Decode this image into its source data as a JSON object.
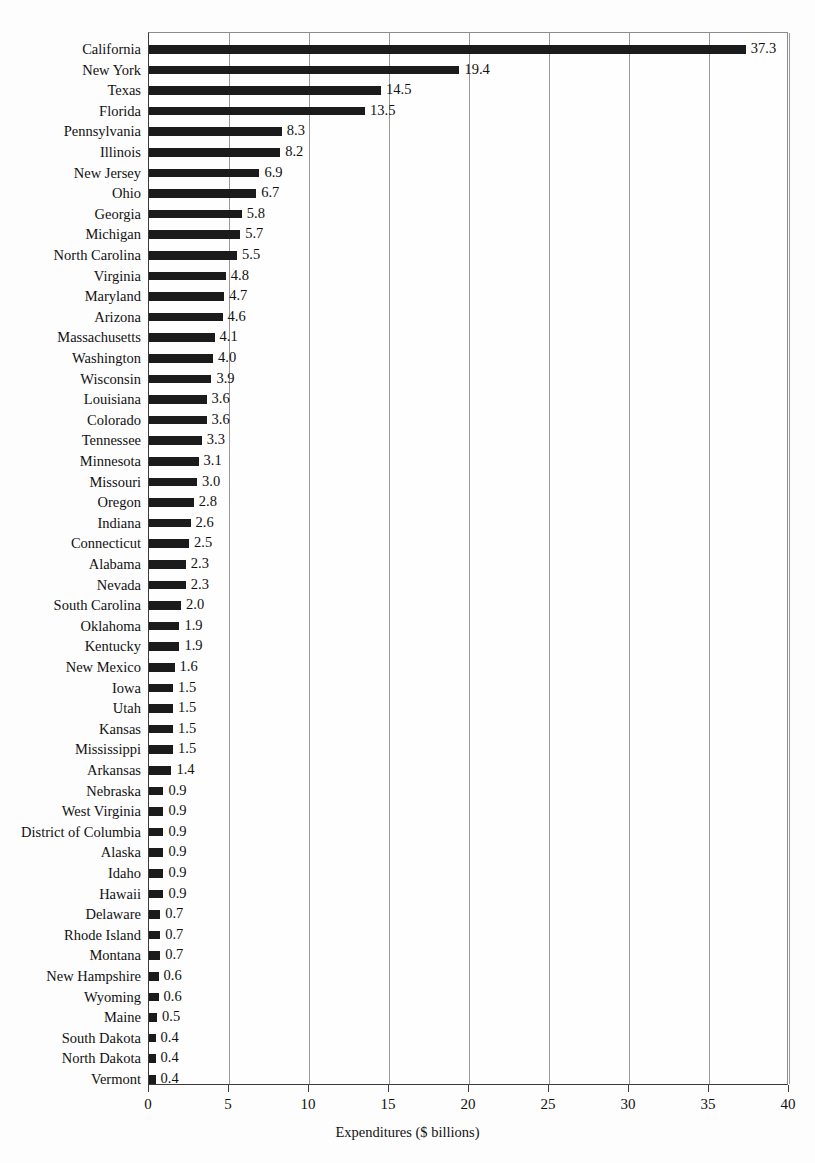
{
  "chart_data": {
    "type": "bar",
    "orientation": "horizontal",
    "title": "",
    "xlabel": "Expenditures ($ billions)",
    "ylabel": "",
    "xlim": [
      0,
      40
    ],
    "xticks": [
      0,
      5,
      10,
      15,
      20,
      25,
      30,
      35,
      40
    ],
    "grid": "vertical",
    "legend": "none",
    "bar_color": "#1b1b1b",
    "categories": [
      "California",
      "New York",
      "Texas",
      "Florida",
      "Pennsylvania",
      "Illinois",
      "New Jersey",
      "Ohio",
      "Georgia",
      "Michigan",
      "North Carolina",
      "Virginia",
      "Maryland",
      "Arizona",
      "Massachusetts",
      "Washington",
      "Wisconsin",
      "Louisiana",
      "Colorado",
      "Tennessee",
      "Minnesota",
      "Missouri",
      "Oregon",
      "Indiana",
      "Connecticut",
      "Alabama",
      "Nevada",
      "South Carolina",
      "Oklahoma",
      "Kentucky",
      "New Mexico",
      "Iowa",
      "Utah",
      "Kansas",
      "Mississippi",
      "Arkansas",
      "Nebraska",
      "West Virginia",
      "District of Columbia",
      "Alaska",
      "Idaho",
      "Hawaii",
      "Delaware",
      "Rhode Island",
      "Montana",
      "New Hampshire",
      "Wyoming",
      "Maine",
      "South Dakota",
      "North Dakota",
      "Vermont"
    ],
    "values": [
      37.3,
      19.4,
      14.5,
      13.5,
      8.3,
      8.2,
      6.9,
      6.7,
      5.8,
      5.7,
      5.5,
      4.8,
      4.7,
      4.6,
      4.1,
      4.0,
      3.9,
      3.6,
      3.6,
      3.3,
      3.1,
      3.0,
      2.8,
      2.6,
      2.5,
      2.3,
      2.3,
      2.0,
      1.9,
      1.9,
      1.6,
      1.5,
      1.5,
      1.5,
      1.5,
      1.4,
      0.9,
      0.9,
      0.9,
      0.9,
      0.9,
      0.9,
      0.7,
      0.7,
      0.7,
      0.6,
      0.6,
      0.5,
      0.4,
      0.4,
      0.4
    ],
    "value_labels": [
      "37.3",
      "19.4",
      "14.5",
      "13.5",
      "8.3",
      "8.2",
      "6.9",
      "6.7",
      "5.8",
      "5.7",
      "5.5",
      "4.8",
      "4.7",
      "4.6",
      "4.1",
      "4.0",
      "3.9",
      "3.6",
      "3.6",
      "3.3",
      "3.1",
      "3.0",
      "2.8",
      "2.6",
      "2.5",
      "2.3",
      "2.3",
      "2.0",
      "1.9",
      "1.9",
      "1.6",
      "1.5",
      "1.5",
      "1.5",
      "1.5",
      "1.4",
      "0.9",
      "0.9",
      "0.9",
      "0.9",
      "0.9",
      "0.9",
      "0.7",
      "0.7",
      "0.7",
      "0.6",
      "0.6",
      "0.5",
      "0.4",
      "0.4",
      "0.4"
    ],
    "xtick_labels": [
      "0",
      "5",
      "10",
      "15",
      "20",
      "25",
      "30",
      "35",
      "40"
    ]
  }
}
